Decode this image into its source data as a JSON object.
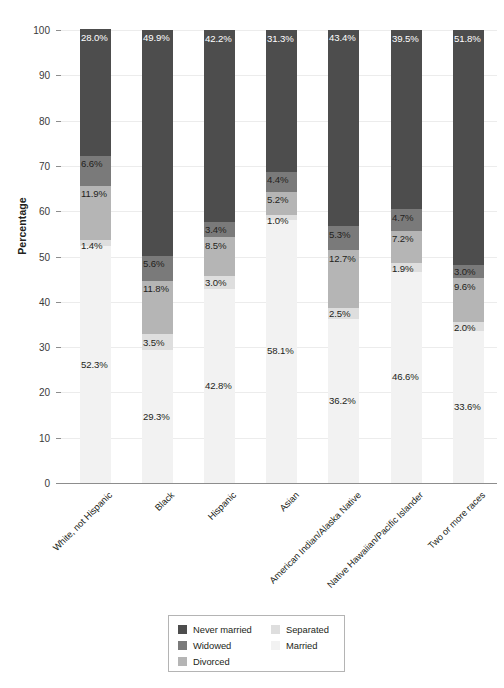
{
  "chart_data": {
    "type": "bar",
    "subtype": "stacked-bar-100",
    "title": "",
    "xlabel": "",
    "ylabel": "Percentage",
    "ylim": [
      0,
      100
    ],
    "ytick_values": [
      0,
      10,
      20,
      30,
      40,
      50,
      60,
      70,
      80,
      90,
      100
    ],
    "ytick_labels": [
      "0",
      "10",
      "20",
      "30",
      "40",
      "50",
      "60",
      "70",
      "80",
      "90",
      "100"
    ],
    "grid": true,
    "legend_position": "bottom-center",
    "value_suffix": "%",
    "categories": [
      "White, not Hispanic",
      "Black",
      "Hispanic",
      "Asian",
      "American Indian/Alaska Native",
      "Native Hawaiian/Pacific Islander",
      "Two or more races"
    ],
    "stack_order_bottom_to_top": [
      "Married",
      "Separated",
      "Divorced",
      "Widowed",
      "Never married"
    ],
    "series": [
      {
        "name": "Never married",
        "color": "#4d4d4d",
        "values": [
          28.0,
          49.9,
          42.2,
          31.3,
          43.4,
          39.5,
          51.8
        ],
        "labels": [
          "28.0%",
          "49.9%",
          "42.2%",
          "31.3%",
          "43.4%",
          "39.5%",
          "51.8%"
        ]
      },
      {
        "name": "Widowed",
        "color": "#7a7a7a",
        "values": [
          6.6,
          5.6,
          3.4,
          4.4,
          5.3,
          4.7,
          3.0
        ],
        "labels": [
          "6.6%",
          "5.6%",
          "3.4%",
          "4.4%",
          "5.3%",
          "4.7%",
          "3.0%"
        ]
      },
      {
        "name": "Divorced",
        "color": "#b5b5b5",
        "values": [
          11.9,
          11.8,
          8.5,
          5.2,
          12.7,
          7.2,
          9.6
        ],
        "labels": [
          "11.9%",
          "11.8%",
          "8.5%",
          "5.2%",
          "12.7%",
          "7.2%",
          "9.6%"
        ]
      },
      {
        "name": "Separated",
        "color": "#dedede",
        "values": [
          1.4,
          3.5,
          3.0,
          1.0,
          2.5,
          1.9,
          2.0
        ],
        "labels": [
          "1.4%",
          "3.5%",
          "3.0%",
          "1.0%",
          "2.5%",
          "1.9%",
          "2.0%"
        ]
      },
      {
        "name": "Married",
        "color": "#f2f2f2",
        "values": [
          52.3,
          29.3,
          42.8,
          58.1,
          36.2,
          46.6,
          33.6
        ],
        "labels": [
          "52.3%",
          "29.3%",
          "42.8%",
          "58.1%",
          "36.2%",
          "46.6%",
          "33.6%"
        ]
      }
    ]
  },
  "legend": {
    "column1": [
      "Never married",
      "Widowed",
      "Divorced"
    ],
    "column2": [
      "Separated",
      "Married"
    ]
  },
  "colors": {
    "never_married": "#4d4d4d",
    "widowed": "#7a7a7a",
    "divorced": "#b5b5b5",
    "separated": "#dedede",
    "married": "#f2f2f2",
    "axis": "#8d8d8d",
    "grid": "#ececec",
    "text": "#231f20"
  }
}
